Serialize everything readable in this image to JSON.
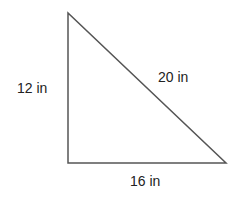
{
  "diagram": {
    "type": "right-triangle",
    "vertices": {
      "top": [
        68,
        13
      ],
      "right_angle": [
        68,
        163
      ],
      "bottom_right": [
        226,
        163
      ]
    },
    "stroke_color": "#555555",
    "labels": {
      "left_side": "12 in",
      "hypotenuse": "20 in",
      "base": "16 in"
    }
  }
}
